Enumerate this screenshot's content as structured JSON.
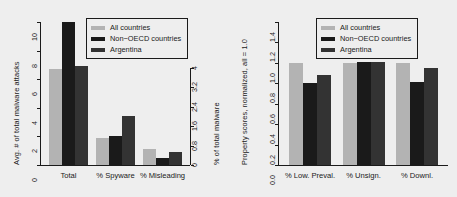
{
  "figure": {
    "background": "#eeeeee",
    "page_background": "#ffffff"
  },
  "series_colors": {
    "all_countries": "#b3b3b3",
    "non_oecd": "#1a1a1a",
    "argentina": "#333333"
  },
  "legend": {
    "items": [
      {
        "label": "All countries",
        "color": "#b3b3b3"
      },
      {
        "label": "Non−OECD countries",
        "color": "#1a1a1a"
      },
      {
        "label": "Argentina",
        "color": "#333333"
      }
    ]
  },
  "chart_data": [
    {
      "type": "bar",
      "id": "malware-attacks",
      "title": "",
      "xlabel": "",
      "ylabel": "Avg. # of total malware attacks",
      "ylabel_secondary": "% of total malware",
      "categories": [
        "Total",
        "% Spyware",
        "% Misleading"
      ],
      "series": [
        {
          "name": "All countries",
          "values": [
            6.7,
            1.9,
            1.1
          ]
        },
        {
          "name": "Non−OECD countries",
          "values": [
            10.0,
            2.0,
            0.5
          ]
        },
        {
          "name": "Argentina",
          "values": [
            6.9,
            3.4,
            0.9
          ]
        }
      ],
      "ylim": [
        0,
        10
      ],
      "yticks": [
        "0",
        "2",
        "4",
        "6",
        "8",
        "10"
      ],
      "ylim_secondary": [
        0,
        4
      ],
      "yticks_secondary": [
        "0",
        "0.8",
        "1.6",
        "2.4",
        "3.2",
        "4"
      ],
      "grid": false,
      "legend_position": "top-right"
    },
    {
      "type": "bar",
      "id": "property-scores",
      "title": "",
      "xlabel": "",
      "ylabel": "Property scores, normalized, all = 1.0",
      "categories": [
        "% Low. Preval.",
        "% Unsign.",
        "% Downl."
      ],
      "series": [
        {
          "name": "All countries",
          "values": [
            1.0,
            1.0,
            1.0
          ]
        },
        {
          "name": "Non−OECD countries",
          "values": [
            0.8,
            1.01,
            0.81
          ]
        },
        {
          "name": "Argentina",
          "values": [
            0.88,
            1.01,
            0.95
          ]
        }
      ],
      "ylim": [
        0,
        1.4
      ],
      "yticks": [
        "0.0",
        "0.2",
        "0.4",
        "0.6",
        "0.8",
        "1.0",
        "1.2",
        "1.4"
      ],
      "grid": false,
      "legend_position": "top-right"
    }
  ]
}
